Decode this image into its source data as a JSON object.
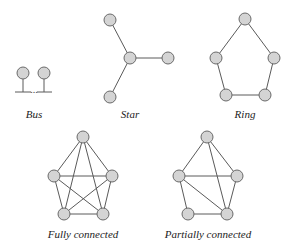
{
  "topologies": [
    {
      "id": "bus",
      "label": "Bus",
      "label_pos": [
        34,
        118
      ],
      "nodes": [
        [
          23,
          73
        ],
        [
          44,
          73
        ]
      ],
      "ellipsis": "...",
      "ellipsis_pos": [
        34,
        93
      ]
    },
    {
      "id": "star",
      "label": "Star",
      "label_pos": [
        130,
        118
      ],
      "nodes": [
        [
          110,
          20
        ],
        [
          130,
          58
        ],
        [
          168,
          58
        ],
        [
          110,
          97
        ]
      ],
      "edges": [
        [
          0,
          1
        ],
        [
          1,
          2
        ],
        [
          1,
          3
        ]
      ]
    },
    {
      "id": "ring",
      "label": "Ring",
      "label_pos": [
        245,
        118
      ],
      "nodes": [
        [
          245,
          19
        ],
        [
          216,
          58
        ],
        [
          274,
          58
        ],
        [
          226,
          95
        ],
        [
          265,
          95
        ]
      ],
      "edges": [
        [
          0,
          1
        ],
        [
          0,
          2
        ],
        [
          1,
          3
        ],
        [
          2,
          4
        ],
        [
          3,
          4
        ]
      ]
    },
    {
      "id": "fully-connected",
      "label": "Fully connected",
      "label_pos": [
        83,
        238
      ],
      "nodes": [
        [
          83,
          137
        ],
        [
          54,
          176
        ],
        [
          112,
          176
        ],
        [
          64,
          214
        ],
        [
          103,
          214
        ]
      ],
      "edges": [
        [
          0,
          1
        ],
        [
          0,
          2
        ],
        [
          0,
          3
        ],
        [
          0,
          4
        ],
        [
          1,
          2
        ],
        [
          1,
          3
        ],
        [
          1,
          4
        ],
        [
          2,
          3
        ],
        [
          2,
          4
        ],
        [
          3,
          4
        ]
      ]
    },
    {
      "id": "partially-connected",
      "label": "Partially connected",
      "label_pos": [
        208,
        238
      ],
      "nodes": [
        [
          207,
          137
        ],
        [
          179,
          176
        ],
        [
          237,
          176
        ],
        [
          188,
          214
        ],
        [
          227,
          214
        ]
      ],
      "edges": [
        [
          0,
          1
        ],
        [
          0,
          2
        ],
        [
          0,
          4
        ],
        [
          1,
          2
        ],
        [
          1,
          3
        ],
        [
          1,
          4
        ],
        [
          2,
          4
        ],
        [
          3,
          4
        ]
      ]
    }
  ],
  "style": {
    "node_fill": "#d4d4d4",
    "node_stroke": "#6a6a6a",
    "edge_color": "#5a5a5a",
    "node_radius": 6
  }
}
